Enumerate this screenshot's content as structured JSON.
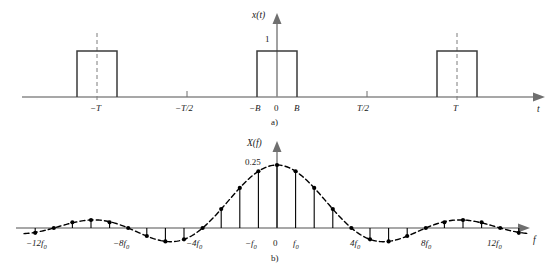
{
  "figure": {
    "panels": [
      {
        "caption": "a)",
        "y_axis_label": "x(t)",
        "x_axis_label": "t",
        "amplitude_label": "1",
        "x_tick_labels": [
          "−T",
          "−T/2",
          "−B",
          "0",
          "B",
          "T/2",
          "T"
        ]
      },
      {
        "caption": "b)",
        "y_axis_label": "X(f)",
        "x_axis_label": "f",
        "peak_label": "0.25",
        "x_tick_labels": [
          "−12f",
          "−8f",
          "−4f",
          "−f",
          "0",
          "f",
          "4f",
          "8f",
          "12f"
        ],
        "x_tick_subscript": "0"
      }
    ]
  },
  "chart_data": [
    {
      "type": "line",
      "title": "",
      "subfigure": "a)",
      "xlabel": "t",
      "ylabel": "x(t)",
      "description": "Periodic rectangular pulse train of amplitude 1, period T, pulse width 2B centered at t = 0, -T and T",
      "amplitude": 1,
      "period_label": "T",
      "pulse_half_width_label": "B",
      "ylim": [
        0,
        1.35
      ],
      "xlim_labels": [
        "-1.45T",
        "1.45T"
      ],
      "grid": false,
      "legend": false,
      "pulses": [
        {
          "center": -1,
          "left": -1.22,
          "right": -0.78,
          "height": 1,
          "center_label": "−T"
        },
        {
          "center": 0,
          "left": -0.22,
          "right": 0.22,
          "height": 1,
          "center_label": "0"
        },
        {
          "center": 1,
          "left": 0.78,
          "right": 1.22,
          "height": 1,
          "center_label": "T"
        }
      ],
      "x_ticks": [
        {
          "position": -1,
          "label": "−T"
        },
        {
          "position": -0.5,
          "label": "−T/2"
        },
        {
          "position": -0.22,
          "label": "−B"
        },
        {
          "position": 0,
          "label": "0"
        },
        {
          "position": 0.22,
          "label": "B"
        },
        {
          "position": 0.5,
          "label": "T/2"
        },
        {
          "position": 1,
          "label": "T"
        }
      ]
    },
    {
      "type": "line",
      "subfigure": "b)",
      "xlabel": "f",
      "ylabel": "X(f)",
      "description": "Fourier series spectrum: discrete spectral lines at multiples of f0 with a sinc envelope, peak value 0.25 at f = 0, zero crossings at +/-4f0, +/-8f0, +/-12f0",
      "peak_value": 0.25,
      "envelope": "sinc",
      "zero_crossings": [
        -12,
        -8,
        -4,
        4,
        8,
        12
      ],
      "ylim": [
        -0.06,
        0.3
      ],
      "xlim": [
        -13.5,
        13.5
      ],
      "grid": false,
      "legend": false,
      "x_ticks": [
        {
          "position": -12,
          "label": "−12f₀"
        },
        {
          "position": -8,
          "label": "−8f₀"
        },
        {
          "position": -4,
          "label": "−4f₀"
        },
        {
          "position": -1,
          "label": "−f₀"
        },
        {
          "position": 0,
          "label": "0"
        },
        {
          "position": 1,
          "label": "f₀"
        },
        {
          "position": 4,
          "label": "4f₀"
        },
        {
          "position": 8,
          "label": "8f₀"
        },
        {
          "position": 12,
          "label": "12f₀"
        }
      ],
      "x": [
        -13,
        -12,
        -11,
        -10,
        -9,
        -8,
        -7,
        -6,
        -5,
        -4,
        -3,
        -2,
        -1,
        0,
        1,
        2,
        3,
        4,
        5,
        6,
        7,
        8,
        9,
        10,
        11,
        12,
        13
      ],
      "values": [
        -0.0192,
        0,
        0.0227,
        0.0318,
        0.0227,
        0,
        -0.0318,
        -0.0531,
        -0.045,
        0,
        0.075,
        0.1592,
        0.2251,
        0.25,
        0.2251,
        0.1592,
        0.075,
        0,
        -0.045,
        -0.0531,
        -0.0318,
        0,
        0.0227,
        0.0318,
        0.0227,
        0,
        -0.0192
      ]
    }
  ]
}
